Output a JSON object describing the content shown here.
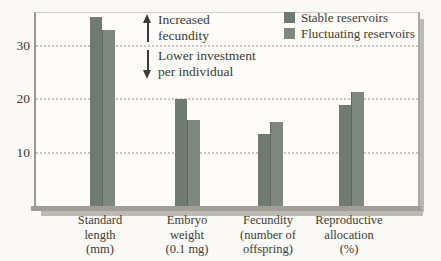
{
  "chart_data": {
    "type": "bar",
    "title": "",
    "xlabel": "",
    "ylabel": "",
    "categories": [
      {
        "label": "Standard\nlength\n(mm)"
      },
      {
        "label": "Embryo\nweight\n(0.1 mg)"
      },
      {
        "label": "Fecundity\n(number of\noffspring)"
      },
      {
        "label": "Reproductive\nallocation\n(%)"
      }
    ],
    "series": [
      {
        "name": "Stable reservoirs",
        "color": "#6f7a71",
        "values": [
          35.5,
          20.3,
          13.6,
          19.0
        ]
      },
      {
        "name": "Fluctuating reservoirs",
        "color": "#7e887d",
        "values": [
          33.2,
          16.3,
          16.0,
          21.5
        ]
      }
    ],
    "yticks": [
      10,
      20,
      30
    ],
    "ylim": [
      0,
      36.3
    ],
    "grid": "horizontal-dotted",
    "legend_position": "top-right"
  },
  "annotations": {
    "up": {
      "icon": "up-arrow",
      "text": "Increased\nfecundity"
    },
    "down": {
      "icon": "down-arrow",
      "text": "Lower investment\nper individual"
    }
  },
  "colors": {
    "axis": "#9a9893",
    "grid": "#c9c7c0",
    "text": "#3c3b35",
    "baseline": "#a09e99",
    "shadow": "#bcbab5",
    "background": "#faf9f6"
  }
}
